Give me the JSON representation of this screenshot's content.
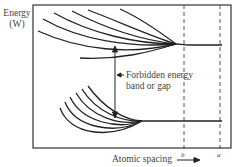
{
  "y_axis_label_line1": "Energy",
  "y_axis_label_line2": "(W)",
  "gap_label_line1": "Forbidden energy",
  "gap_label_line2": "band or gap",
  "x_axis_label": "Atomic spacing",
  "markers": [
    {
      "label": "b"
    },
    {
      "label": "a"
    }
  ],
  "bands": [
    {
      "name": "upper band",
      "curves": 5
    },
    {
      "name": "lower band",
      "curves": 6
    }
  ]
}
